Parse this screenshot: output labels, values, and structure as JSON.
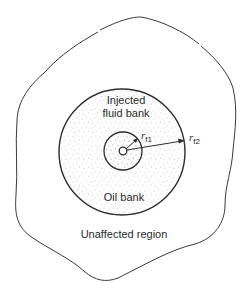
{
  "diagram": {
    "regions": {
      "injected_line1": "Injected",
      "injected_line2": "fluid bank",
      "oil_bank": "Oil bank",
      "unaffected": "Unaffected region"
    },
    "radii": {
      "rf1_symbol": "r",
      "rf1_sub": "f1",
      "rf2_symbol": "r",
      "rf2_sub": "f2"
    },
    "colors": {
      "line": "#3a3a3a",
      "stipple": "#8a8a8a",
      "background": "#ffffff"
    }
  }
}
